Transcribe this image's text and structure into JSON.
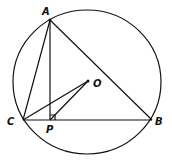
{
  "diagram": {
    "type": "geometry",
    "circle": {
      "center": "O",
      "cx": 87,
      "cy": 82,
      "r": 73
    },
    "points": {
      "A": {
        "label": "A",
        "x": 50,
        "y": 20
      },
      "B": {
        "label": "B",
        "x": 152,
        "y": 120
      },
      "C": {
        "label": "C",
        "x": 23,
        "y": 120
      },
      "P": {
        "label": "P",
        "x": 50,
        "y": 120
      },
      "O": {
        "label": "O",
        "x": 88,
        "y": 81
      }
    },
    "segments": [
      "AB",
      "AC",
      "CB",
      "AP",
      "OC",
      "OP"
    ],
    "right_angle_at": "P"
  }
}
